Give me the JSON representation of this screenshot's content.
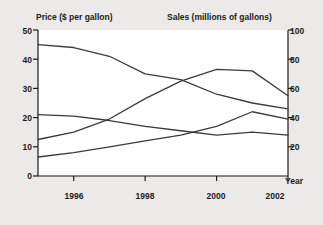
{
  "chart_data": {
    "type": "line",
    "title": "",
    "background": "#eceae8",
    "plot_background": "#ffffff",
    "line_color": "#3a3a3a",
    "grid": false,
    "legend_position": "inline-labels",
    "left_axis": {
      "label": "Price ($ per gallon)",
      "ticks": [
        0,
        10,
        20,
        30,
        40,
        50
      ],
      "ylim": [
        0,
        50
      ]
    },
    "right_axis": {
      "label": "Sales (millions of gallons)",
      "ticks": [
        20,
        40,
        60,
        80,
        100
      ],
      "ylim": [
        0,
        100
      ]
    },
    "x_axis": {
      "label": "Year",
      "ticks": [
        1996,
        1998,
        2000,
        2002
      ],
      "xlim": [
        1995,
        2002
      ]
    },
    "x": [
      1995,
      1996,
      1997,
      1998,
      1999,
      2000,
      2001,
      2002
    ],
    "series": [
      {
        "name": "P_U",
        "label_text": "P",
        "label_sub": "U",
        "axis": "left",
        "units": "dollars per gallon",
        "values": [
          45.0,
          44.0,
          41.0,
          35.0,
          33.0,
          28.0,
          25.0,
          23.0
        ]
      },
      {
        "name": "P_O",
        "label_text": "P",
        "label_sub": "O",
        "axis": "left",
        "units": "dollars per gallon",
        "values": [
          21.0,
          20.5,
          19.0,
          17.0,
          15.5,
          14.0,
          15.0,
          14.0
        ]
      },
      {
        "name": "q_U",
        "label_text": "q",
        "label_sub": "U",
        "axis": "right",
        "units": "millions of gallons",
        "values": [
          13.0,
          16.0,
          20.0,
          24.0,
          28.0,
          34.0,
          44.0,
          39.0
        ]
      },
      {
        "name": "q_O",
        "label_text": "q",
        "label_sub": "O",
        "axis": "right",
        "units": "millions of gallons",
        "values": [
          25.0,
          30.0,
          39.0,
          53.0,
          65.0,
          73.0,
          72.0,
          55.0
        ]
      }
    ],
    "annotations": [
      {
        "name": "label-p-u",
        "text": "P",
        "sub": "U",
        "x_px": 60,
        "y_px": 58
      },
      {
        "name": "label-p-o",
        "text": "P",
        "sub": "O",
        "x_px": 60,
        "y_px": 110
      },
      {
        "name": "label-q-o",
        "text": "q",
        "sub": "O",
        "x_px": 200,
        "y_px": 58
      },
      {
        "name": "label-q-u",
        "text": "q",
        "sub": "U",
        "x_px": 200,
        "y_px": 112
      }
    ]
  }
}
